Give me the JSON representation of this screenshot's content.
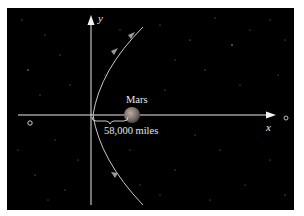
{
  "diagram": {
    "title": "",
    "background_color": "#000000",
    "axes": {
      "x_label": "x",
      "y_label": "y",
      "axis_color": "#e8e8e8"
    },
    "planet": {
      "name": "Mars",
      "color": "#8a7f78"
    },
    "distance_label": "58,000 miles",
    "path": {
      "type": "hyperbola",
      "color": "#c9c9c9",
      "direction_markers": 3
    },
    "other_bodies": [
      {
        "name": "small-moon-left"
      },
      {
        "name": "small-moon-right"
      }
    ]
  }
}
